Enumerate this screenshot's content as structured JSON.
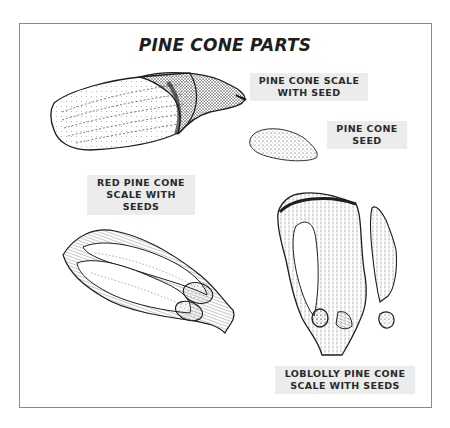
{
  "diagram": {
    "title": "PINE CONE PARTS",
    "labels": {
      "scale_with_seed": [
        "PINE CONE SCALE",
        "WITH SEED"
      ],
      "seed": [
        "PINE CONE",
        "SEED"
      ],
      "red_pine": [
        "RED PINE CONE",
        "SCALE WITH",
        "SEEDS"
      ],
      "loblolly": [
        "LOBLOLLY PINE CONE",
        "SCALE WITH SEEDS"
      ]
    },
    "illustrations": [
      {
        "name": "pine-cone-scale-with-seed",
        "position": "top-left"
      },
      {
        "name": "pine-cone-seed",
        "position": "top-right"
      },
      {
        "name": "red-pine-cone-scale-with-seeds",
        "position": "bottom-left"
      },
      {
        "name": "loblolly-pine-cone-scale-with-seeds",
        "position": "bottom-right"
      }
    ],
    "colors": {
      "ink": "#1e1e1e",
      "label_bg": "#ececec",
      "frame_border": "#8a8a8a"
    }
  }
}
